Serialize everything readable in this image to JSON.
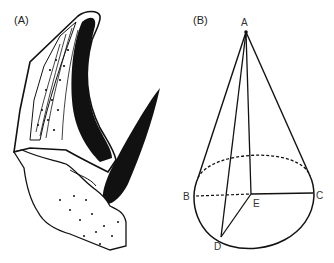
{
  "panels": [
    {
      "id": "A",
      "label": "(A)",
      "description": "Cross-sectional illustration of a horn and its core"
    },
    {
      "id": "B",
      "label": "(B)",
      "description": "Geometric cone model",
      "points": {
        "A": "A",
        "B": "B",
        "C": "C",
        "D": "D",
        "E": "E"
      }
    }
  ]
}
